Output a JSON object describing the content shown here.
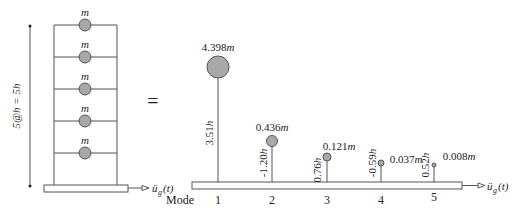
{
  "figure": {
    "equals": "=",
    "building": {
      "story_count": 5,
      "mass_label": "m",
      "height_label": "5@h = 5h",
      "excitation_label": "ü_g(t)",
      "excitation_base": "ü",
      "excitation_sub": "g",
      "excitation_arg": "(t)"
    },
    "modal": {
      "mode_label": "Mode",
      "excitation_base": "ü",
      "excitation_sub": "g",
      "excitation_arg": "(t)",
      "modes": [
        {
          "number": "1",
          "mass": "4.398",
          "mass_unit": "m",
          "height": "3.51",
          "height_unit": "h"
        },
        {
          "number": "2",
          "mass": "0.436",
          "mass_unit": "m",
          "height": "-1.20",
          "height_unit": "h"
        },
        {
          "number": "3",
          "mass": "0.121",
          "mass_unit": "m",
          "height": "0.76",
          "height_unit": "h"
        },
        {
          "number": "4",
          "mass": "0.037",
          "mass_unit": "m",
          "height": "-0.59",
          "height_unit": "h"
        },
        {
          "number": "5",
          "mass": "0.008",
          "mass_unit": "m",
          "height": "0.52",
          "height_unit": "h"
        }
      ]
    },
    "colors": {
      "line": "#555555",
      "mass_fill": "#a8a8a8",
      "mass_stroke": "#555555"
    }
  }
}
